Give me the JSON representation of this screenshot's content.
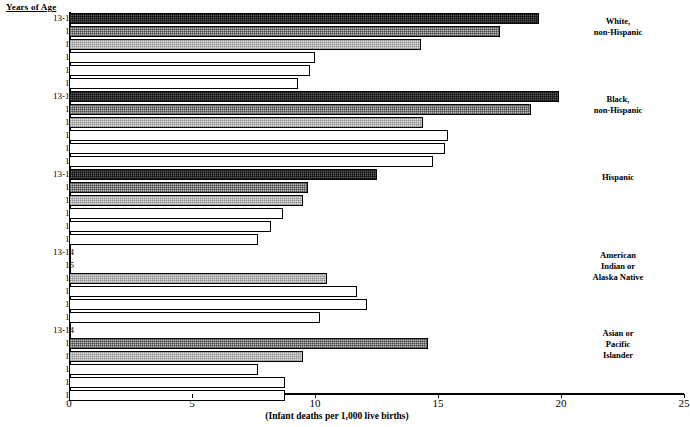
{
  "axis_header": "Years of Age",
  "x_axis": {
    "title": "(Infant deaths per 1,000 live births)",
    "ticks": [
      0,
      5,
      10,
      15,
      20,
      25
    ],
    "min": 0,
    "max": 25
  },
  "groups": [
    {
      "name": "White,\nnon-Hispanic",
      "rows": [
        {
          "label": "13-14",
          "value": 19.1,
          "fill": "fill-dark"
        },
        {
          "label": "15",
          "value": 17.5,
          "fill": "fill-mid"
        },
        {
          "label": "16",
          "value": 14.3,
          "fill": "fill-light"
        },
        {
          "label": "17",
          "value": 10.0,
          "fill": "fill-white"
        },
        {
          "label": "18",
          "value": 9.8,
          "fill": "fill-white"
        },
        {
          "label": "19",
          "value": 9.3,
          "fill": "fill-white"
        }
      ]
    },
    {
      "name": "Black,\nnon-Hispanic",
      "rows": [
        {
          "label": "13-14",
          "value": 19.9,
          "fill": "fill-dark"
        },
        {
          "label": "15",
          "value": 18.8,
          "fill": "fill-mid"
        },
        {
          "label": "16",
          "value": 14.4,
          "fill": "fill-light"
        },
        {
          "label": "17",
          "value": 15.4,
          "fill": "fill-white"
        },
        {
          "label": "18",
          "value": 15.3,
          "fill": "fill-white"
        },
        {
          "label": "19",
          "value": 14.8,
          "fill": "fill-white"
        }
      ]
    },
    {
      "name": "Hispanic",
      "rows": [
        {
          "label": "13-14",
          "value": 12.5,
          "fill": "fill-dark"
        },
        {
          "label": "15",
          "value": 9.7,
          "fill": "fill-mid"
        },
        {
          "label": "16",
          "value": 9.5,
          "fill": "fill-light"
        },
        {
          "label": "17",
          "value": 8.7,
          "fill": "fill-white"
        },
        {
          "label": "18",
          "value": 8.2,
          "fill": "fill-white"
        },
        {
          "label": "19",
          "value": 7.7,
          "fill": "fill-white"
        }
      ]
    },
    {
      "name": "American Indian or Alaska Native",
      "rows": [
        {
          "label": "13-14",
          "value": 0,
          "fill": "fill-dark"
        },
        {
          "label": "15",
          "value": 0,
          "fill": "fill-mid"
        },
        {
          "label": "16",
          "value": 10.5,
          "fill": "fill-light"
        },
        {
          "label": "17",
          "value": 11.7,
          "fill": "fill-white"
        },
        {
          "label": "18",
          "value": 12.1,
          "fill": "fill-white"
        },
        {
          "label": "19",
          "value": 10.2,
          "fill": "fill-white"
        }
      ]
    },
    {
      "name": "Asian or Pacific Islander",
      "rows": [
        {
          "label": "13-14",
          "value": 0,
          "fill": "fill-dark"
        },
        {
          "label": "15",
          "value": 14.6,
          "fill": "fill-mid"
        },
        {
          "label": "16",
          "value": 9.5,
          "fill": "fill-light"
        },
        {
          "label": "17",
          "value": 7.7,
          "fill": "fill-white"
        },
        {
          "label": "18",
          "value": 8.8,
          "fill": "fill-white"
        },
        {
          "label": "19",
          "value": 8.8,
          "fill": "fill-white"
        }
      ]
    }
  ],
  "chart_data": {
    "type": "bar",
    "orientation": "horizontal",
    "title": "",
    "xlabel": "(Infant deaths per 1,000 live births)",
    "ylabel": "Years of Age",
    "xlim": [
      0,
      25
    ],
    "xticks": [
      0,
      5,
      10,
      15,
      20,
      25
    ],
    "grid": false,
    "legend": "none",
    "categories": [
      "13-14",
      "15",
      "16",
      "17",
      "18",
      "19"
    ],
    "series": [
      {
        "name": "White, non-Hispanic",
        "values": [
          19.1,
          17.5,
          14.3,
          10.0,
          9.8,
          9.3
        ]
      },
      {
        "name": "Black, non-Hispanic",
        "values": [
          19.9,
          18.8,
          14.4,
          15.4,
          15.3,
          14.8
        ]
      },
      {
        "name": "Hispanic",
        "values": [
          12.5,
          9.7,
          9.5,
          8.7,
          8.2,
          7.7
        ]
      },
      {
        "name": "American Indian or Alaska Native",
        "values": [
          null,
          null,
          10.5,
          11.7,
          12.1,
          10.2
        ]
      },
      {
        "name": "Asian or Pacific Islander",
        "values": [
          null,
          14.6,
          9.5,
          7.7,
          8.8,
          8.8
        ]
      }
    ],
    "annotations": [
      "White, non-Hispanic",
      "Black, non-Hispanic",
      "Hispanic",
      "American Indian or Alaska Native",
      "Asian or Pacific Islander"
    ]
  }
}
